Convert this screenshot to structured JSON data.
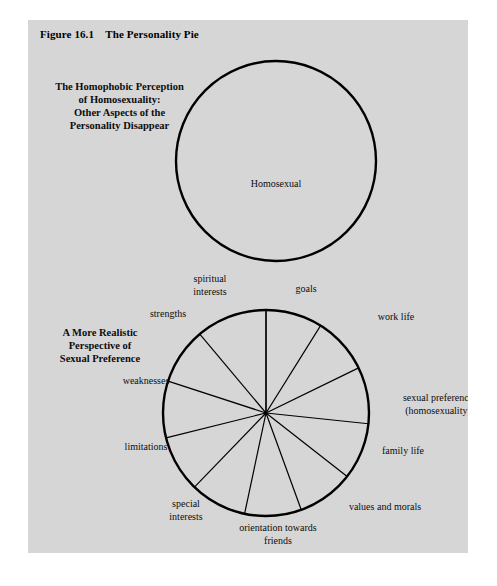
{
  "figure": {
    "title": "Figure 16.1    The Personality Pie",
    "panel_bg": "#d6d6d6",
    "page_bg": "#ffffff",
    "ink": "#000000"
  },
  "captions": {
    "top": "The Homophobic Perception\nof Homosexuality:\nOther Aspects of the\nPersonality Disappear",
    "bottom": "A More Realistic\nPerspective of\nSexual Preference"
  },
  "top_circle": {
    "label": "Homosexual",
    "cx": 248,
    "cy": 141,
    "r": 100
  },
  "chart_data": {
    "type": "pie",
    "title": "The Personality Pie",
    "subtitle": "A More Realistic Perspective of Sexual Preference",
    "cx": 238,
    "cy": 393,
    "r": 103,
    "grid": false,
    "legend": "none",
    "note": "Eleven equal-appearing sectors of a personality pie; each sector is one aspect of the personality.",
    "categories": [
      "goals",
      "work life",
      "sexual preference (homosexuality)",
      "family life",
      "values and morals",
      "orientation towards friends",
      "special interests",
      "limitations",
      "weaknesses",
      "strengths",
      "spiritual interests"
    ],
    "values": [
      9.09,
      9.09,
      9.09,
      9.09,
      9.09,
      9.09,
      9.09,
      9.09,
      9.09,
      9.09,
      9.09
    ],
    "slice_angles_deg": [
      {
        "name": "goals",
        "start": -90,
        "end": -58
      },
      {
        "name": "work life",
        "start": -58,
        "end": -26
      },
      {
        "name": "sexual preference (homosexuality)",
        "start": -26,
        "end": 6
      },
      {
        "name": "family life",
        "start": 6,
        "end": 38
      },
      {
        "name": "values and morals",
        "start": 38,
        "end": 70
      },
      {
        "name": "orientation towards friends",
        "start": 70,
        "end": 102
      },
      {
        "name": "special interests",
        "start": 102,
        "end": 134
      },
      {
        "name": "limitations",
        "start": 134,
        "end": 166
      },
      {
        "name": "weaknesses",
        "start": 166,
        "end": 198
      },
      {
        "name": "strengths",
        "start": 198,
        "end": 230
      },
      {
        "name": "spiritual interests",
        "start": 230,
        "end": 270
      }
    ],
    "labels": [
      {
        "text": "spiritual",
        "x": 182,
        "y": 262,
        "anchor": "middle"
      },
      {
        "text": "interests",
        "x": 182,
        "y": 275,
        "anchor": "middle"
      },
      {
        "text": "goals",
        "x": 278,
        "y": 272,
        "anchor": "middle"
      },
      {
        "text": "strengths",
        "x": 140,
        "y": 297,
        "anchor": "middle"
      },
      {
        "text": "work life",
        "x": 368,
        "y": 300,
        "anchor": "middle"
      },
      {
        "text": "weaknesses",
        "x": 118,
        "y": 364,
        "anchor": "middle"
      },
      {
        "text": "sexual preference",
        "x": 410,
        "y": 381,
        "anchor": "middle"
      },
      {
        "text": "(homosexuality)",
        "x": 410,
        "y": 394,
        "anchor": "middle"
      },
      {
        "text": "limitations",
        "x": 118,
        "y": 430,
        "anchor": "middle"
      },
      {
        "text": "family life",
        "x": 375,
        "y": 434,
        "anchor": "middle"
      },
      {
        "text": "special",
        "x": 158,
        "y": 487,
        "anchor": "middle"
      },
      {
        "text": "interests",
        "x": 158,
        "y": 500,
        "anchor": "middle"
      },
      {
        "text": "values and morals",
        "x": 357,
        "y": 490,
        "anchor": "middle"
      },
      {
        "text": "orientation towards",
        "x": 250,
        "y": 511,
        "anchor": "middle"
      },
      {
        "text": "friends",
        "x": 250,
        "y": 524,
        "anchor": "middle"
      }
    ]
  }
}
